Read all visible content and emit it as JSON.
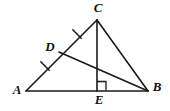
{
  "figure": {
    "background_color": "#ffffff",
    "stroke_color": "#1a1a1a",
    "width": 170,
    "height": 111
  },
  "points": {
    "A": {
      "label": "A",
      "x": 26,
      "y": 91,
      "label_x": 17,
      "label_y": 91
    },
    "B": {
      "label": "B",
      "x": 148,
      "y": 91,
      "label_x": 157,
      "label_y": 88
    },
    "C": {
      "label": "C",
      "x": 97,
      "y": 20,
      "label_x": 98,
      "label_y": 9
    },
    "D": {
      "label": "D",
      "x": 59,
      "y": 52,
      "label_x": 50,
      "label_y": 48
    },
    "E": {
      "label": "E",
      "x": 97,
      "y": 91,
      "label_x": 99,
      "label_y": 101
    }
  },
  "segments": [
    {
      "name": "AB",
      "from": "A",
      "to": "B"
    },
    {
      "name": "AC",
      "from": "A",
      "to": "C"
    },
    {
      "name": "CB",
      "from": "C",
      "to": "B"
    },
    {
      "name": "CE",
      "from": "C",
      "to": "E"
    },
    {
      "name": "DB",
      "from": "D",
      "to": "B"
    }
  ],
  "tick_marks": [
    {
      "name": "tick-AD",
      "on_segment": "AD",
      "cx": 45,
      "cy": 66,
      "count": 1
    },
    {
      "name": "tick-DC",
      "on_segment": "DC",
      "cx": 77,
      "cy": 34,
      "count": 1
    }
  ],
  "right_angle": {
    "name": "right-angle-at-E",
    "vertex": "E",
    "x": 97,
    "y": 81,
    "size": 9,
    "measure": "90"
  }
}
